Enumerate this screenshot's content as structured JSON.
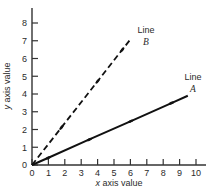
{
  "chart_data": {
    "type": "line",
    "title": "",
    "xlabel": "x axis value",
    "ylabel": "y axis value",
    "xlim": [
      0,
      10.4
    ],
    "ylim": [
      0,
      8.6
    ],
    "xticks": [
      0,
      1,
      2,
      3,
      4,
      5,
      6,
      7,
      8,
      9,
      10
    ],
    "xtick_labels": [
      "0",
      "1",
      "2",
      "3",
      "4",
      "5",
      "6",
      "7",
      "8",
      "9",
      "10"
    ],
    "yticks": [
      0,
      1,
      2,
      3,
      4,
      5,
      6,
      7,
      8
    ],
    "ytick_labels": [
      "0",
      "1",
      "2",
      "3",
      "4",
      "5",
      "6",
      "7",
      "8"
    ],
    "grid": false,
    "legend_position": "inline-at-line-end",
    "series": [
      {
        "name": "Line A",
        "label_text": "Line",
        "label_id": "A",
        "style": "solid",
        "color": "#111111",
        "slope": 0.41,
        "x": [
          0,
          1,
          3.5,
          6,
          8.5,
          9.5
        ],
        "y": [
          0,
          0.41,
          1.44,
          2.46,
          3.49,
          3.9
        ],
        "markers_x": [
          1,
          3.5,
          6,
          8.5
        ],
        "markers_y": [
          0.41,
          1.44,
          2.46,
          3.49
        ]
      },
      {
        "name": "Line B",
        "label_text": "Line",
        "label_id": "B",
        "style": "dashed",
        "color": "#111111",
        "slope": 1.18,
        "x": [
          0,
          1.8,
          4,
          5.5,
          5.95
        ],
        "y": [
          0,
          2.12,
          4.72,
          6.49,
          7.02
        ],
        "markers_x": [
          1.8,
          4,
          5.5
        ],
        "markers_y": [
          2.12,
          4.72,
          6.49
        ]
      }
    ]
  },
  "axes": {
    "x_title_var": "x",
    "x_title_rest": " axis value",
    "y_title_var": "y",
    "y_title_rest": " axis value"
  }
}
